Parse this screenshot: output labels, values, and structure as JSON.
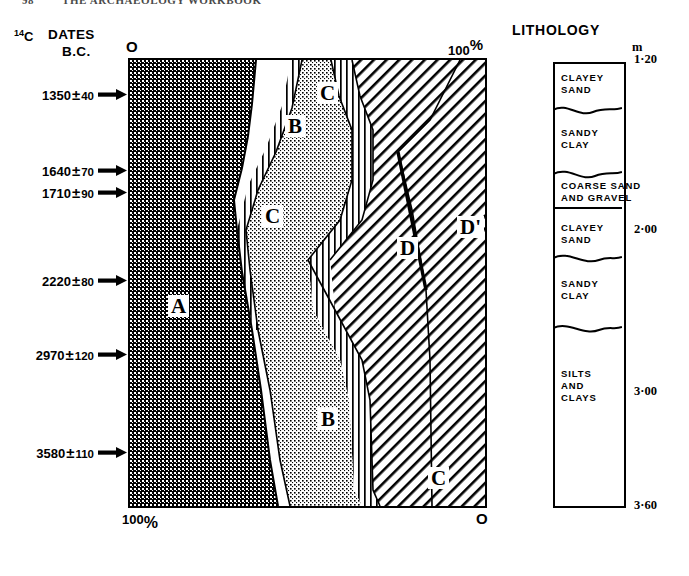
{
  "running_head": {
    "folio": "98",
    "title": "THE ARCHAEOLOGY WORKBOOK"
  },
  "header": {
    "c14_prefix": "14",
    "c14_suffix": "C",
    "dates_label": "DATES",
    "bc_label": "B.C."
  },
  "dates": [
    {
      "value": "1350",
      "pm": "±",
      "error": "40",
      "y": 94
    },
    {
      "value": "1640",
      "pm": "±",
      "error": "70",
      "y": 170
    },
    {
      "value": "1710",
      "pm": "±",
      "error": "90",
      "y": 192
    },
    {
      "value": "2220",
      "pm": "±",
      "error": "80",
      "y": 280
    },
    {
      "value": "2970",
      "pm": "±",
      "error": "120",
      "y": 354
    },
    {
      "value": "3580",
      "pm": "±",
      "error": "110",
      "y": 452
    }
  ],
  "pollen": {
    "axis_top_left": "O",
    "axis_top_right": "100",
    "axis_top_right_pct": "%",
    "axis_bottom_left": "100",
    "axis_bottom_left_pct": "%",
    "axis_bottom_right": "O",
    "zone_labels": [
      {
        "name": "A",
        "text": "A",
        "x": 168,
        "y": 295
      },
      {
        "name": "B-upper",
        "text": "B",
        "x": 285,
        "y": 115
      },
      {
        "name": "C-upper",
        "text": "C",
        "x": 317,
        "y": 82
      },
      {
        "name": "C-mid",
        "text": "C",
        "x": 262,
        "y": 205
      },
      {
        "name": "D",
        "text": "D",
        "x": 397,
        "y": 237
      },
      {
        "name": "D-prime",
        "text": "D'",
        "x": 457,
        "y": 216
      },
      {
        "name": "B-lower",
        "text": "B",
        "x": 318,
        "y": 408
      },
      {
        "name": "C-lower",
        "text": "C",
        "x": 428,
        "y": 467
      }
    ]
  },
  "lithology": {
    "title": "LITHOLOGY",
    "unit_symbol": "m",
    "units": [
      {
        "name": "clayey-sand-upper",
        "lines": [
          "CLAYEY",
          "SAND"
        ],
        "y": 72
      },
      {
        "name": "sandy-clay-upper",
        "lines": [
          "SANDY",
          "CLAY"
        ],
        "y": 127
      },
      {
        "name": "coarse-sand-gravel",
        "lines": [
          "COARSE SAND",
          "AND GRAVEL"
        ],
        "y": 180
      },
      {
        "name": "clayey-sand-lower",
        "lines": [
          "CLAYEY",
          "SAND"
        ],
        "y": 222
      },
      {
        "name": "sandy-clay-lower",
        "lines": [
          "SANDY",
          "CLAY"
        ],
        "y": 278
      },
      {
        "name": "silts-and-clays",
        "lines": [
          "SILTS",
          "AND",
          "CLAYS"
        ],
        "y": 368
      }
    ],
    "depths": [
      {
        "label": "1·20",
        "y": 52
      },
      {
        "label": "2·00",
        "y": 222
      },
      {
        "label": "3·00",
        "y": 384
      },
      {
        "label": "3·60",
        "y": 498
      }
    ]
  },
  "colors": {
    "ink": "#000000",
    "paper": "#ffffff",
    "zone_a_fill": "#3a3a3a",
    "zone_b_fill": "#c9c9c9"
  }
}
